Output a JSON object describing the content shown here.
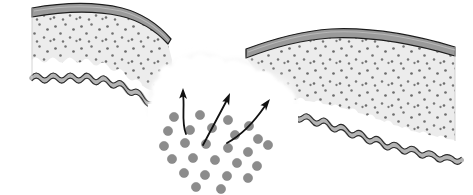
{
  "figure": {
    "domain": "Diagram",
    "kind": "biological-cross-section",
    "title": "Particle penetration through a breached tissue barrier",
    "background_color": "#ffffff",
    "width": 473,
    "height": 195
  },
  "palette": {
    "background": "#ffffff",
    "outline": "#1c1c1c",
    "outline_soft": "#3a3a3a",
    "corneum_fill": "#9a9a9a",
    "corneum_fill_light": "#a8a8a8",
    "dermis_fill": "#ececec",
    "dermis_speckle": "#6e6e6e",
    "membrane_fill": "#b4b4b4",
    "membrane_outline": "#2a2a2a",
    "particle_fill": "#8c8c8c",
    "particle_stroke": "#7a7a7a",
    "breach_fill": "#ffffff",
    "breach_halo": "#f2f2f2",
    "arrow_color": "#111111"
  },
  "layers": [
    {
      "id": "stratum-corneum",
      "label": "Outer barrier band",
      "fill": "#9a9a9a",
      "stroke": "#1c1c1c",
      "thickness_px": 9,
      "description": "Dark grey banded outermost layer following the upper contour"
    },
    {
      "id": "dermis-body",
      "label": "Speckled tissue body",
      "fill": "#ececec",
      "speckle_color": "#6e6e6e",
      "speckle_count": 236,
      "description": "Light grey matrix filled with small dark dots"
    },
    {
      "id": "basement-membrane",
      "label": "Wavy basal membrane",
      "fill": "#b4b4b4",
      "stroke": "#2a2a2a",
      "amplitude_px": 4,
      "wavelength_px": 17,
      "description": "Undulating grey ribbon bounding the tissue from below"
    }
  ],
  "segments": {
    "left": {
      "id": "left-tissue-segment",
      "label": "Left tissue segment",
      "x_start": 32,
      "x_end": 168,
      "top_y": 8,
      "bottom_y": 86
    },
    "right": {
      "id": "right-tissue-segment",
      "label": "Right tissue segment",
      "x_start": 246,
      "x_end": 455,
      "top_y": 36,
      "bottom_y": 140
    }
  },
  "breach": {
    "id": "breach-gap",
    "label": "Breach in the barrier",
    "center_x": 212,
    "center_y": 84,
    "width_px": 112,
    "edge_style": "soft scalloped cloud",
    "fill": "#ffffff"
  },
  "particles": {
    "label": "Particle cluster",
    "count": 26,
    "fill": "#8c8c8c",
    "radius_px": 4.6,
    "cluster_center_x": 210,
    "cluster_center_y": 148,
    "points": [
      [
        174,
        117
      ],
      [
        200,
        115
      ],
      [
        228,
        120
      ],
      [
        249,
        126
      ],
      [
        168,
        131
      ],
      [
        190,
        130
      ],
      [
        212,
        128
      ],
      [
        235,
        135
      ],
      [
        258,
        139
      ],
      [
        164,
        146
      ],
      [
        185,
        143
      ],
      [
        206,
        144
      ],
      [
        228,
        148
      ],
      [
        248,
        152
      ],
      [
        268,
        145
      ],
      [
        172,
        159
      ],
      [
        193,
        158
      ],
      [
        215,
        160
      ],
      [
        237,
        163
      ],
      [
        257,
        166
      ],
      [
        184,
        173
      ],
      [
        205,
        175
      ],
      [
        227,
        176
      ],
      [
        248,
        178
      ],
      [
        196,
        187
      ],
      [
        221,
        189
      ]
    ]
  },
  "arrows": {
    "label": "Penetration direction arrows",
    "count": 3,
    "color": "#111111",
    "stroke_width_px": 1.8,
    "items": [
      {
        "id": "arrow-left",
        "label": "Left penetration arrow",
        "from": [
          185,
          132
        ],
        "to": [
          183,
          89
        ],
        "angle_deg": 87,
        "curved": true
      },
      {
        "id": "arrow-middle",
        "label": "Middle penetration arrow",
        "from": [
          204,
          143
        ],
        "to": [
          228,
          94
        ],
        "angle_deg": 64,
        "curved": false
      },
      {
        "id": "arrow-right",
        "label": "Right penetration arrow",
        "from": [
          228,
          142
        ],
        "to": [
          268,
          99
        ],
        "angle_deg": 47,
        "curved": true
      }
    ]
  },
  "annotations": {
    "text_labels": [],
    "note": "The figure carries no visible text, axis ticks, legend or caption."
  }
}
